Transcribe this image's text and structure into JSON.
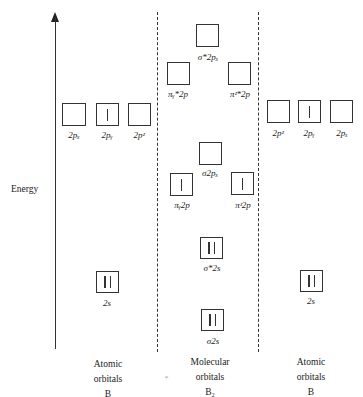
{
  "axis": {
    "label": "Energy"
  },
  "columns": {
    "left": {
      "title_line1": "Atomic",
      "title_line2": "orbitals",
      "title_line3": "B"
    },
    "middle": {
      "title_line1": "Molecular",
      "title_line2": "orbitals",
      "title_line3": "B₂"
    },
    "right": {
      "title_line1": "Atomic",
      "title_line2": "orbitals",
      "title_line3": "B"
    }
  },
  "orbitals": {
    "left_2px": {
      "label": "2pₓ",
      "electrons": 0
    },
    "left_2py": {
      "label": "2pᵧ",
      "electrons": 1
    },
    "left_2pz": {
      "label": "2pᶻ",
      "electrons": 0
    },
    "left_2s": {
      "label": "2s",
      "electrons": 2
    },
    "sigma_star_2px": {
      "label": "σ*2pₓ",
      "electrons": 0
    },
    "pi_star_y_2p": {
      "label": "πᵧ*2p",
      "electrons": 0
    },
    "pi_star_z_2p": {
      "label": "πᶻ*2p",
      "electrons": 0
    },
    "sigma_2px": {
      "label": "σ2pₓ",
      "electrons": 0
    },
    "pi_y_2p": {
      "label": "πᵧ2p",
      "electrons": 1
    },
    "pi_z_2p": {
      "label": "πᶻ2p",
      "electrons": 1
    },
    "sigma_star_2s": {
      "label": "σ*2s",
      "electrons": 2
    },
    "sigma_2s": {
      "label": "σ2s",
      "electrons": 2
    },
    "right_2pz": {
      "label": "2pᶻ",
      "electrons": 0
    },
    "right_2py": {
      "label": "2pᵧ",
      "electrons": 1
    },
    "right_2px": {
      "label": "2pₓ",
      "electrons": 0
    },
    "right_2s": {
      "label": "2s",
      "electrons": 2
    }
  },
  "stray_mark": "ᵩ"
}
